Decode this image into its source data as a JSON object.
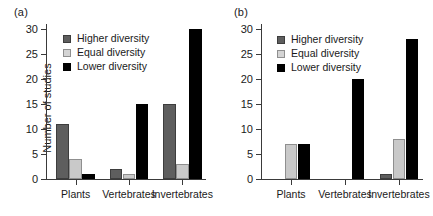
{
  "figure": {
    "panels": [
      {
        "id": "a",
        "label": "(a)",
        "ylabel": "Number of studies",
        "show_ylabel": true
      },
      {
        "id": "b",
        "label": "(b)",
        "ylabel": "",
        "show_ylabel": false
      }
    ],
    "legend": {
      "higher": "Higher diversity",
      "equal": "Equal diversity",
      "lower": "Lower diversity"
    },
    "colors": {
      "higher": "#5e5e5e",
      "equal": "#c9c9c9",
      "lower": "#000000",
      "axis": "#3a3a3a",
      "background": "#ffffff"
    }
  },
  "chart_data": [
    {
      "type": "bar",
      "title": "(a)",
      "xlabel": "",
      "ylabel": "Number of studies",
      "categories": [
        "Plants",
        "Vertebrates",
        "Invertebrates"
      ],
      "series": [
        {
          "name": "Higher diversity",
          "values": [
            11,
            2,
            15
          ]
        },
        {
          "name": "Equal diversity",
          "values": [
            4,
            1,
            3
          ]
        },
        {
          "name": "Lower diversity",
          "values": [
            1,
            15,
            30
          ]
        }
      ],
      "yticks": [
        0,
        5,
        10,
        15,
        20,
        25,
        30
      ],
      "ylim": [
        0,
        30
      ],
      "grid": false,
      "legend_position": "upper-left"
    },
    {
      "type": "bar",
      "title": "(b)",
      "xlabel": "",
      "ylabel": "",
      "categories": [
        "Plants",
        "Vertebrates",
        "Invertebrates"
      ],
      "series": [
        {
          "name": "Higher diversity",
          "values": [
            0,
            0,
            1
          ]
        },
        {
          "name": "Equal diversity",
          "values": [
            7,
            0,
            8
          ]
        },
        {
          "name": "Lower diversity",
          "values": [
            7,
            20,
            28
          ]
        }
      ],
      "yticks": [
        0,
        5,
        10,
        15,
        20,
        25,
        30
      ],
      "ylim": [
        0,
        30
      ],
      "grid": false,
      "legend_position": "upper-left"
    }
  ]
}
